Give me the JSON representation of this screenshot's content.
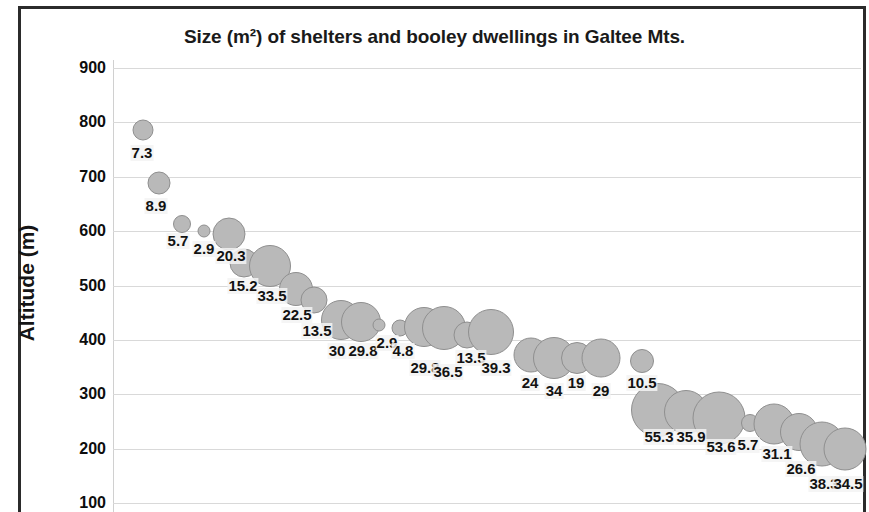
{
  "chart": {
    "title": "Size (m²) of shelters and booley dwellings in Galtee Mts.",
    "y_axis_title": "Altitude (m)"
  },
  "chart_data": {
    "type": "scatter",
    "subtype": "bubble",
    "title": "Size (m²) of shelters and booley dwellings in Galtee Mts.",
    "xlabel": "",
    "ylabel": "Altitude (m)",
    "ylim": [
      100,
      900
    ],
    "y_ticks": [
      900,
      800,
      700,
      600,
      500,
      400,
      300,
      200,
      100
    ],
    "grid": true,
    "legend": "none",
    "bubble_value_unit": "m²",
    "bubble_fill_color": "#b9b9b9",
    "bubble_border_color": "#8f8f8f",
    "points": [
      {
        "label": "7.3",
        "size": 7.3,
        "altitude": 781,
        "x_px": 143,
        "y_px": 130,
        "r_px": 10.5
      },
      {
        "label": "8.9",
        "size": 8.9,
        "altitude": 685,
        "x_px": 159,
        "y_px": 183,
        "r_px": 11.5
      },
      {
        "label": "5.7",
        "size": 5.7,
        "altitude": 610,
        "x_px": 182,
        "y_px": 224,
        "r_px": 9.0
      },
      {
        "label": "2.9",
        "size": 2.9,
        "altitude": 597,
        "x_px": 204,
        "y_px": 231,
        "r_px": 6.5
      },
      {
        "label": "20.3",
        "size": 20.3,
        "altitude": 593,
        "x_px": 229,
        "y_px": 234,
        "r_px": 16.5
      },
      {
        "label": "15.2",
        "size": 15.2,
        "altitude": 540,
        "x_px": 244,
        "y_px": 263,
        "r_px": 14.5
      },
      {
        "label": "33.5",
        "size": 33.5,
        "altitude": 533,
        "x_px": 270,
        "y_px": 266,
        "r_px": 21.0
      },
      {
        "label": "22.5",
        "size": 22.5,
        "altitude": 492,
        "x_px": 296,
        "y_px": 289,
        "r_px": 17.0
      },
      {
        "label": "13.5",
        "size": 13.5,
        "altitude": 472,
        "x_px": 314,
        "y_px": 300,
        "r_px": 13.5
      },
      {
        "label": "30",
        "size": 30.0,
        "altitude": 436,
        "x_px": 341,
        "y_px": 320,
        "r_px": 20.0
      },
      {
        "label": "29.8",
        "size": 29.8,
        "altitude": 432,
        "x_px": 361,
        "y_px": 322,
        "r_px": 20.0
      },
      {
        "label": "2.9",
        "size": 2.9,
        "altitude": 427,
        "x_px": 379,
        "y_px": 325,
        "r_px": 6.5
      },
      {
        "label": "4.8",
        "size": 4.8,
        "altitude": 421,
        "x_px": 400,
        "y_px": 328,
        "r_px": 8.5
      },
      {
        "label": "29.8",
        "size": 29.8,
        "altitude": 423,
        "x_px": 424,
        "y_px": 327,
        "r_px": 20.0
      },
      {
        "label": "36.5",
        "size": 36.5,
        "altitude": 421,
        "x_px": 444,
        "y_px": 328,
        "r_px": 22.0
      },
      {
        "label": "13.5",
        "size": 13.5,
        "altitude": 408,
        "x_px": 467,
        "y_px": 335,
        "r_px": 13.5
      },
      {
        "label": "39.3",
        "size": 39.3,
        "altitude": 414,
        "x_px": 491,
        "y_px": 332,
        "r_px": 23.0
      },
      {
        "label": "24",
        "size": 24.0,
        "altitude": 372,
        "x_px": 531,
        "y_px": 355,
        "r_px": 17.5
      },
      {
        "label": "34",
        "size": 34.0,
        "altitude": 366,
        "x_px": 554,
        "y_px": 358,
        "r_px": 21.0
      },
      {
        "label": "19",
        "size": 19.0,
        "altitude": 366,
        "x_px": 577,
        "y_px": 358,
        "r_px": 16.0
      },
      {
        "label": "29",
        "size": 29.0,
        "altitude": 366,
        "x_px": 601,
        "y_px": 358,
        "r_px": 19.5
      },
      {
        "label": "10.5",
        "size": 10.5,
        "altitude": 361,
        "x_px": 642,
        "y_px": 361,
        "r_px": 12.0
      },
      {
        "label": "55.3",
        "size": 55.3,
        "altitude": 271,
        "x_px": 658,
        "y_px": 410,
        "r_px": 27.0
      },
      {
        "label": "35.9",
        "size": 35.9,
        "altitude": 268,
        "x_px": 686,
        "y_px": 412,
        "r_px": 22.0
      },
      {
        "label": "53.6",
        "size": 53.6,
        "altitude": 257,
        "x_px": 719,
        "y_px": 418,
        "r_px": 26.5
      },
      {
        "label": "5.7",
        "size": 5.7,
        "altitude": 248,
        "x_px": 750,
        "y_px": 423,
        "r_px": 9.0
      },
      {
        "label": "31.1",
        "size": 31.1,
        "altitude": 246,
        "x_px": 774,
        "y_px": 424,
        "r_px": 20.5
      },
      {
        "label": "26.6",
        "size": 26.6,
        "altitude": 231,
        "x_px": 799,
        "y_px": 432,
        "r_px": 19.0
      },
      {
        "label": "38.3",
        "size": 38.3,
        "altitude": 209,
        "x_px": 822,
        "y_px": 444,
        "r_px": 22.5
      },
      {
        "label": "34.5",
        "size": 34.5,
        "altitude": 200,
        "x_px": 845,
        "y_px": 449,
        "r_px": 21.5
      }
    ],
    "labels_px": [
      {
        "text": "7.3",
        "x_px": 142,
        "y_px": 145
      },
      {
        "text": "8.9",
        "x_px": 156,
        "y_px": 198
      },
      {
        "text": "5.7",
        "x_px": 178,
        "y_px": 233
      },
      {
        "text": "2.9",
        "x_px": 204,
        "y_px": 241
      },
      {
        "text": "20.3",
        "x_px": 231,
        "y_px": 248
      },
      {
        "text": "15.2",
        "x_px": 243,
        "y_px": 278
      },
      {
        "text": "33.5",
        "x_px": 272,
        "y_px": 288
      },
      {
        "text": "22.5",
        "x_px": 297,
        "y_px": 307
      },
      {
        "text": "13.5",
        "x_px": 317,
        "y_px": 323
      },
      {
        "text": "30",
        "x_px": 337,
        "y_px": 343
      },
      {
        "text": "29.8",
        "x_px": 363,
        "y_px": 343
      },
      {
        "text": "2.9",
        "x_px": 387,
        "y_px": 335
      },
      {
        "text": "4.8",
        "x_px": 403,
        "y_px": 343
      },
      {
        "text": "29.8",
        "x_px": 425,
        "y_px": 360
      },
      {
        "text": "36.5",
        "x_px": 448,
        "y_px": 364
      },
      {
        "text": "13.5",
        "x_px": 471,
        "y_px": 350
      },
      {
        "text": "39.3",
        "x_px": 496,
        "y_px": 360
      },
      {
        "text": "24",
        "x_px": 530,
        "y_px": 375
      },
      {
        "text": "34",
        "x_px": 554,
        "y_px": 383
      },
      {
        "text": "19",
        "x_px": 576,
        "y_px": 375
      },
      {
        "text": "29",
        "x_px": 601,
        "y_px": 383
      },
      {
        "text": "10.5",
        "x_px": 642,
        "y_px": 375
      },
      {
        "text": "55.3",
        "x_px": 659,
        "y_px": 429
      },
      {
        "text": "35.9",
        "x_px": 691,
        "y_px": 429
      },
      {
        "text": "53.6",
        "x_px": 721,
        "y_px": 439
      },
      {
        "text": "5.7",
        "x_px": 748,
        "y_px": 437
      },
      {
        "text": "31.1",
        "x_px": 777,
        "y_px": 446
      },
      {
        "text": "26.6",
        "x_px": 801,
        "y_px": 461
      },
      {
        "text": "38.3",
        "x_px": 824,
        "y_px": 476
      },
      {
        "text": "34.5",
        "x_px": 848,
        "y_px": 476
      }
    ]
  }
}
